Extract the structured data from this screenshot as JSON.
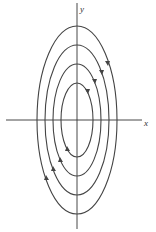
{
  "diagram": {
    "type": "phase-portrait",
    "axes": {
      "x_label": "x",
      "y_label": "y",
      "origin": [
        77,
        120
      ],
      "x_range_px": [
        6,
        142
      ],
      "y_range_px": [
        3,
        229
      ]
    },
    "ellipses": [
      {
        "rx": 40,
        "ry": 94
      },
      {
        "rx": 32,
        "ry": 75
      },
      {
        "rx": 24,
        "ry": 56
      },
      {
        "rx": 16,
        "ry": 37
      }
    ],
    "direction": "clockwise",
    "colors": {
      "curve": "#444444",
      "axis": "#333333"
    }
  }
}
